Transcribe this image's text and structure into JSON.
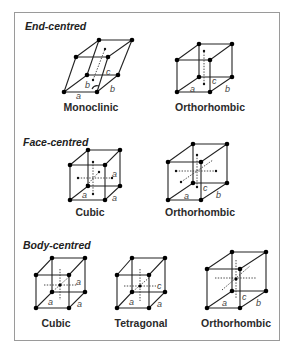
{
  "sections": [
    {
      "title": "End-centred",
      "lattices": [
        {
          "name": "Monoclinic",
          "axes": [
            "a",
            "b",
            "b",
            "c"
          ]
        },
        {
          "name": "Orthorhombic",
          "axes": [
            "a",
            "b",
            "c"
          ]
        }
      ]
    },
    {
      "title": "Face-centred",
      "lattices": [
        {
          "name": "Cubic",
          "axes": [
            "a",
            "a",
            "a"
          ]
        },
        {
          "name": "Orthorhombic",
          "axes": [
            "a",
            "b",
            "c"
          ]
        }
      ]
    },
    {
      "title": "Body-centred",
      "lattices": [
        {
          "name": "Cubic",
          "axes": [
            "a",
            "a",
            "a"
          ]
        },
        {
          "name": "Tetragonal",
          "axes": [
            "a",
            "a",
            "c"
          ]
        },
        {
          "name": "Orthorhombic",
          "axes": [
            "a",
            "b",
            "c"
          ]
        }
      ]
    }
  ],
  "colors": {
    "frame": "#9a9a9a",
    "lines": "#222222",
    "points": "#000000",
    "axis_labels": "#444444"
  }
}
